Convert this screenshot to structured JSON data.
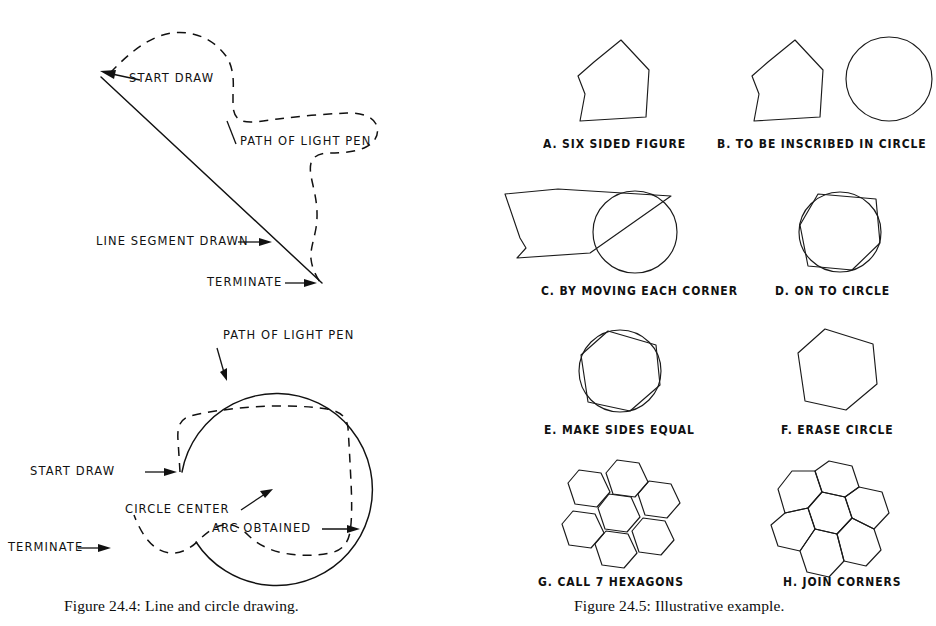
{
  "page": {
    "background_color": "#ffffff",
    "ink_color": "#111111",
    "width": 936,
    "height": 626
  },
  "figure_left": {
    "id": "figure-24-4",
    "caption": "Figure  24.4: Line and circle drawing.",
    "diagram_line": {
      "title": "line drawing with light pen",
      "annotations": [
        {
          "key": "start_draw",
          "text": "START DRAW"
        },
        {
          "key": "path_of_light_pen",
          "text": "PATH OF LIGHT PEN"
        },
        {
          "key": "line_segment",
          "text": "LINE SEGMENT DRAWN"
        },
        {
          "key": "terminate",
          "text": "TERMINATE"
        }
      ]
    },
    "diagram_circle": {
      "title": "circle drawing with light pen",
      "annotations": [
        {
          "key": "path_of_light_pen",
          "text": "PATH OF LIGHT PEN"
        },
        {
          "key": "start_draw",
          "text": "START DRAW"
        },
        {
          "key": "circle_center",
          "text": "CIRCLE CENTER"
        },
        {
          "key": "arc_obtained",
          "text": "ARC OBTAINED"
        },
        {
          "key": "terminate",
          "text": "TERMINATE"
        }
      ]
    }
  },
  "figure_right": {
    "id": "figure-24-5",
    "caption": "Figure  24.5: Illustrative example.",
    "panels": [
      {
        "key": "a",
        "label": "A. SIX SIDED FIGURE"
      },
      {
        "key": "b",
        "label": "B. TO BE INSCRIBED IN CIRCLE"
      },
      {
        "key": "c",
        "label": "C. BY MOVING EACH CORNER"
      },
      {
        "key": "d",
        "label": "D. ON TO CIRCLE"
      },
      {
        "key": "e",
        "label": "E. MAKE SIDES EQUAL"
      },
      {
        "key": "f",
        "label": "F. ERASE CIRCLE"
      },
      {
        "key": "g",
        "label": "G. CALL 7 HEXAGONS"
      },
      {
        "key": "h",
        "label": "H. JOIN CORNERS"
      }
    ]
  }
}
